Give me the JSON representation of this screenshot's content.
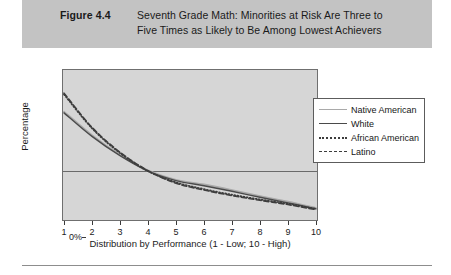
{
  "caption": {
    "figure_number": "Figure 4.4",
    "line1": "Seventh Grade Math: Minorities at Risk Are Three to",
    "line2": "Five Times as Likely to Be Among Lowest Achievers"
  },
  "chart_data": {
    "type": "line",
    "title": "Seventh Grade Math: Minorities at Risk Are Three to Five Times as Likely to Be Among Lowest Achievers",
    "xlabel": "Distribution by Performance  (1 - Low; 10 - High)",
    "ylabel": "Percentage",
    "x": [
      1,
      2,
      3,
      4,
      5,
      6,
      7,
      8,
      9,
      10
    ],
    "xticklabels": [
      "1",
      "2",
      "3",
      "4",
      "5",
      "6",
      "7",
      "8",
      "9",
      "10"
    ],
    "yticklabels": [
      "0%",
      "5%",
      "10%",
      "15%",
      "20%",
      "25%",
      "30%",
      "35%"
    ],
    "ytickvalues": [
      0,
      5,
      10,
      15,
      20,
      25,
      30,
      35
    ],
    "ylim": [
      0,
      35
    ],
    "xlim": [
      1,
      10
    ],
    "grid": "horizontal-10-percent-only",
    "legend_position": "right",
    "series": [
      {
        "name": "Native American",
        "style": "solid",
        "color": "#a9a9a9",
        "values": [
          25.3,
          19.8,
          15.2,
          11.6,
          9.4,
          8.3,
          7.0,
          5.6,
          4.3,
          2.8
        ]
      },
      {
        "name": "White",
        "style": "solid",
        "color": "#4a4a4a",
        "values": [
          25.0,
          19.5,
          15.0,
          11.4,
          9.2,
          8.0,
          6.7,
          5.3,
          4.0,
          2.6
        ]
      },
      {
        "name": "African American",
        "style": "dotted",
        "color": "#3d3d3d",
        "values": [
          29.3,
          21.4,
          15.6,
          11.4,
          8.8,
          7.2,
          5.9,
          4.8,
          3.8,
          2.6
        ]
      },
      {
        "name": "Latino",
        "style": "dashed",
        "color": "#3d3d3d",
        "values": [
          29.6,
          21.6,
          15.8,
          11.5,
          8.6,
          7.0,
          5.7,
          4.6,
          3.6,
          2.4
        ]
      }
    ]
  },
  "legend": {
    "items": [
      {
        "label": "Native American",
        "swatch": "solid-light"
      },
      {
        "label": "White",
        "swatch": "solid-dark"
      },
      {
        "label": "African American",
        "swatch": "dotted"
      },
      {
        "label": "Latino",
        "swatch": "dashed"
      }
    ]
  }
}
